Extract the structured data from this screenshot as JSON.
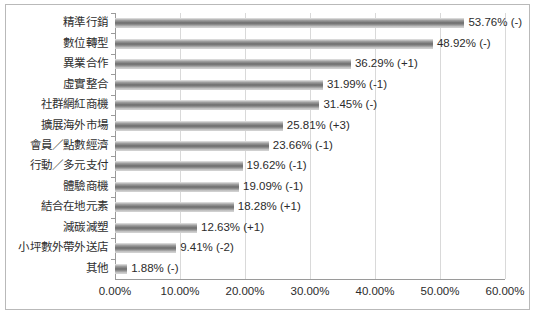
{
  "chart_data": {
    "type": "bar",
    "orientation": "horizontal",
    "title": "",
    "subtitle": "",
    "xlabel": "",
    "ylabel": "",
    "xlim": [
      0,
      60
    ],
    "xticks": [
      "0.00%",
      "10.00%",
      "20.00%",
      "30.00%",
      "40.00%",
      "50.00%",
      "60.00%"
    ],
    "xtick_values": [
      0,
      10,
      20,
      30,
      40,
      50,
      60
    ],
    "grid": "vertical",
    "legend": "none",
    "categories": [
      "精準行銷",
      "數位轉型",
      "異業合作",
      "虛實整合",
      "社群網紅商機",
      "擴展海外市場",
      "會員／點數經濟",
      "行動／多元支付",
      "體驗商機",
      "結合在地元素",
      "減碳減塑",
      "小坪數外帶外送店",
      "其他"
    ],
    "values": [
      53.76,
      48.92,
      36.29,
      31.99,
      31.45,
      25.81,
      23.66,
      19.62,
      19.09,
      18.28,
      12.63,
      9.41,
      1.88
    ],
    "data_labels": [
      "53.76% (-)",
      "48.92% (-)",
      "36.29% (+1)",
      "31.99% (-1)",
      "31.45% (-)",
      "25.81% (+3)",
      "23.66% (-1)",
      "19.62% (-1)",
      "19.09% (-1)",
      "18.28% (+1)",
      "12.63% (+1)",
      "9.41% (-2)",
      "1.88% (-)"
    ],
    "rank_changes": [
      "-",
      "-",
      "+1",
      "-1",
      "-",
      "+3",
      "-1",
      "-1",
      "-1",
      "+1",
      "+1",
      "-2",
      "-"
    ],
    "colors": {
      "bar_light": "#c8c8c8",
      "bar_dark": "#6f6f6f",
      "gridline": "#d9d9d9",
      "axis": "#9a9a9a",
      "text": "#2b2b2b",
      "border": "#b9b9b9",
      "background": "#ffffff"
    }
  }
}
